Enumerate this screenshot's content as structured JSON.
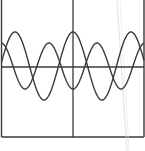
{
  "diagram": {
    "type": "waveform-plot",
    "frame": {
      "left": 1.5,
      "right": 144,
      "top": 0,
      "bottom": 137
    },
    "axes": {
      "horizontal_y": 67,
      "vertical_x": 73
    },
    "stroke_color": "#3a3a3a",
    "artifact_line_color": "#d8d8d8",
    "waves": [
      {
        "name": "wave-a",
        "baseline": 66,
        "amplitude": 34,
        "period": 58,
        "phase_peak_x": 15
      },
      {
        "name": "wave-b",
        "baseline": 66,
        "amplitude": 23,
        "period": 48,
        "phase_peak_x": 49
      }
    ]
  }
}
